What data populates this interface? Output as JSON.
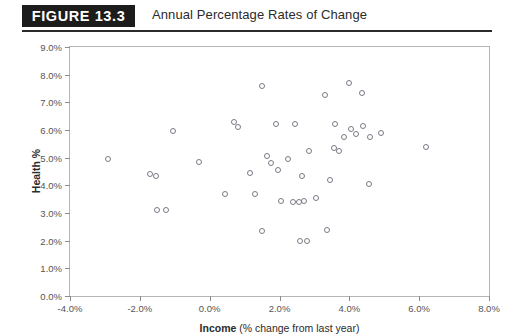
{
  "header": {
    "badge_label": "FIGURE  13.3",
    "title": "Annual Percentage Rates of Change"
  },
  "chart_data": {
    "type": "scatter",
    "title": "Annual Percentage Rates of Change",
    "xlabel_bold": "Income",
    "xlabel_rest": " (% change from last year)",
    "ylabel": "Health %",
    "xlim": [
      -4.0,
      8.0
    ],
    "ylim": [
      0.0,
      9.0
    ],
    "grid": false,
    "legend": null,
    "x_ticks": [
      "-4.0%",
      "-2.0%",
      "0.0%",
      "2.0%",
      "4.0%",
      "6.0%",
      "8.0%"
    ],
    "x_tick_values": [
      -4.0,
      -2.0,
      0.0,
      2.0,
      4.0,
      6.0,
      8.0
    ],
    "y_ticks": [
      "0.0%",
      "1.0%",
      "2.0%",
      "3.0%",
      "4.0%",
      "5.0%",
      "6.0%",
      "7.0%",
      "8.0%",
      "9.0%"
    ],
    "y_tick_values": [
      0.0,
      1.0,
      2.0,
      3.0,
      4.0,
      5.0,
      6.0,
      7.0,
      8.0,
      9.0
    ],
    "marker": "open-circle",
    "marker_color": "#7a7a86",
    "points": [
      {
        "x": -2.9,
        "y": 4.95
      },
      {
        "x": -1.7,
        "y": 4.4
      },
      {
        "x": -1.55,
        "y": 4.35
      },
      {
        "x": -1.5,
        "y": 3.1
      },
      {
        "x": -1.25,
        "y": 3.1
      },
      {
        "x": -1.05,
        "y": 5.95
      },
      {
        "x": -0.3,
        "y": 4.85
      },
      {
        "x": 0.45,
        "y": 3.7
      },
      {
        "x": 0.7,
        "y": 6.3
      },
      {
        "x": 0.8,
        "y": 6.1
      },
      {
        "x": 1.15,
        "y": 4.45
      },
      {
        "x": 1.3,
        "y": 3.7
      },
      {
        "x": 1.5,
        "y": 7.6
      },
      {
        "x": 1.5,
        "y": 2.35
      },
      {
        "x": 1.65,
        "y": 5.05
      },
      {
        "x": 1.75,
        "y": 4.8
      },
      {
        "x": 1.9,
        "y": 6.2
      },
      {
        "x": 1.95,
        "y": 4.55
      },
      {
        "x": 2.05,
        "y": 3.45
      },
      {
        "x": 2.25,
        "y": 4.95
      },
      {
        "x": 2.4,
        "y": 3.4
      },
      {
        "x": 2.45,
        "y": 6.2
      },
      {
        "x": 2.55,
        "y": 3.4
      },
      {
        "x": 2.6,
        "y": 2.0
      },
      {
        "x": 2.65,
        "y": 4.35
      },
      {
        "x": 2.7,
        "y": 3.45
      },
      {
        "x": 2.8,
        "y": 2.0
      },
      {
        "x": 2.85,
        "y": 5.25
      },
      {
        "x": 3.05,
        "y": 3.55
      },
      {
        "x": 3.3,
        "y": 7.25
      },
      {
        "x": 3.35,
        "y": 2.4
      },
      {
        "x": 3.45,
        "y": 4.2
      },
      {
        "x": 3.55,
        "y": 5.35
      },
      {
        "x": 3.6,
        "y": 6.2
      },
      {
        "x": 3.7,
        "y": 5.25
      },
      {
        "x": 3.85,
        "y": 5.75
      },
      {
        "x": 4.0,
        "y": 7.7
      },
      {
        "x": 4.05,
        "y": 6.05
      },
      {
        "x": 4.2,
        "y": 5.85
      },
      {
        "x": 4.35,
        "y": 7.35
      },
      {
        "x": 4.4,
        "y": 6.15
      },
      {
        "x": 4.55,
        "y": 4.05
      },
      {
        "x": 4.6,
        "y": 5.75
      },
      {
        "x": 4.9,
        "y": 5.9
      },
      {
        "x": 6.2,
        "y": 5.4
      }
    ]
  }
}
